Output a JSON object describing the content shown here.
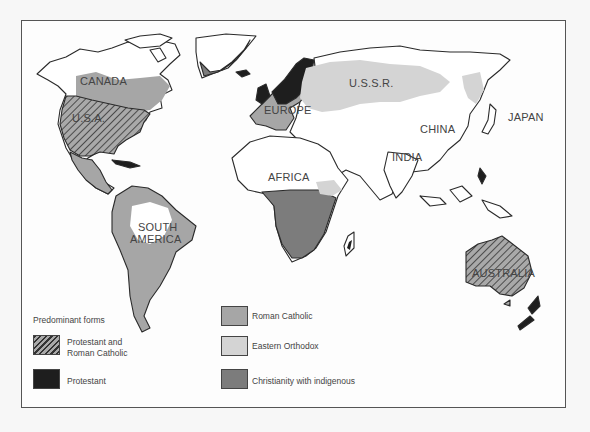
{
  "map": {
    "colors": {
      "protestant": "#1e1e1e",
      "roman_catholic": "#a6a6a6",
      "eastern_orthodox": "#d4d4d4",
      "christianity_indigenous": "#7c7c7c",
      "land": "#ffffff",
      "outline": "#2a2a2a",
      "hatch": "#3a3a3a"
    },
    "labels": {
      "canada": "CANADA",
      "usa": "U.S.A.",
      "europe": "EUROPE",
      "ussr": "U.S.S.R.",
      "china": "CHINA",
      "japan": "JAPAN",
      "india": "INDIA",
      "africa": "AFRICA",
      "south_america_line1": "SOUTH",
      "south_america_line2": "AMERICA",
      "australia": "AUSTRALIA"
    }
  },
  "legend": {
    "title": "Predominant forms",
    "items": [
      {
        "key": "protestant_and_roman_catholic",
        "label_line1": "Protestant and",
        "label_line2": "Roman Catholic",
        "pattern": "hatched"
      },
      {
        "key": "protestant",
        "label": "Protestant",
        "color": "#1e1e1e"
      },
      {
        "key": "roman_catholic",
        "label": "Roman Catholic",
        "color": "#a6a6a6"
      },
      {
        "key": "eastern_orthodox",
        "label": "Eastern Orthodox",
        "color": "#d4d4d4"
      },
      {
        "key": "christianity_indigenous",
        "label": "Christianity with indigenous",
        "color": "#7c7c7c"
      }
    ]
  }
}
